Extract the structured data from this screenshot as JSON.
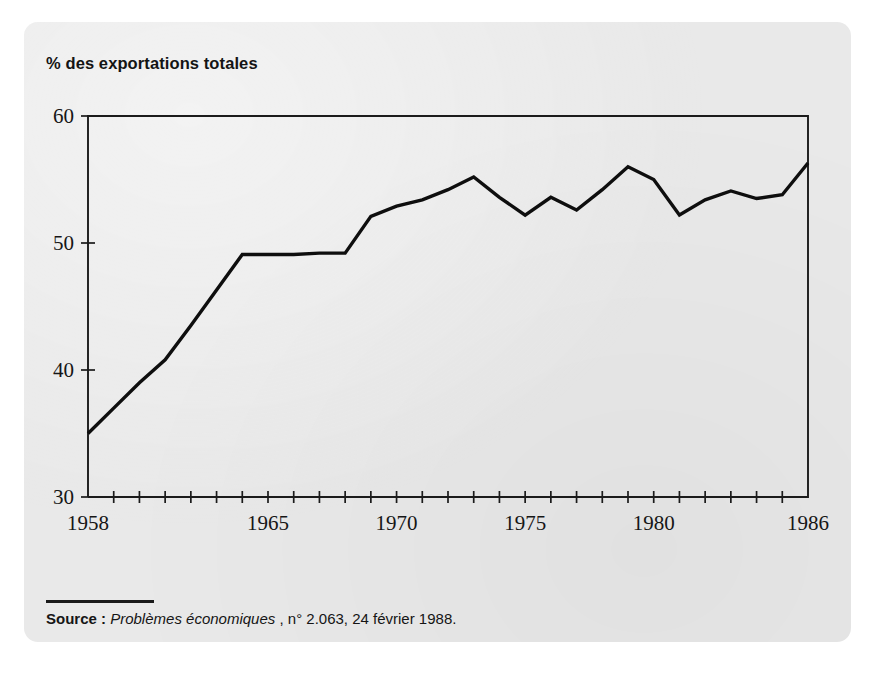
{
  "card": {
    "background_color": "#e9e9e9",
    "page_background_color": "#ffffff"
  },
  "chart_title": "% des exportations totales",
  "source": {
    "lead_label": "Source :",
    "publication": "Problèmes économiques",
    "reference": ", n° 2.063, 24 février 1988."
  },
  "chart_data": {
    "type": "line",
    "title": "% des exportations totales",
    "xlabel": "",
    "ylabel": "% des exportations totales",
    "xlim": [
      1958,
      1986
    ],
    "ylim": [
      30,
      60
    ],
    "ytick_labels": [
      "30",
      "40",
      "50",
      "60"
    ],
    "ytick_values": [
      30,
      40,
      50,
      60
    ],
    "xtick_labels": [
      "1958",
      "1965",
      "1970",
      "1975",
      "1980",
      "1986"
    ],
    "xtick_values": [
      1958,
      1965,
      1970,
      1975,
      1980,
      1986
    ],
    "xtick_minor_step": 1,
    "grid": false,
    "legend": false,
    "line_color": "#0e0e0e",
    "x": [
      1958,
      1959,
      1960,
      1961,
      1962,
      1963,
      1964,
      1965,
      1966,
      1967,
      1968,
      1969,
      1970,
      1971,
      1972,
      1973,
      1974,
      1975,
      1976,
      1977,
      1978,
      1979,
      1980,
      1981,
      1982,
      1983,
      1984,
      1985,
      1986
    ],
    "values": [
      35.0,
      37.0,
      39.0,
      40.8,
      43.5,
      46.3,
      49.1,
      49.1,
      49.1,
      49.2,
      49.2,
      52.1,
      52.9,
      53.4,
      54.2,
      55.2,
      53.6,
      52.2,
      53.6,
      52.6,
      54.2,
      56.0,
      55.0,
      52.2,
      53.4,
      54.1,
      53.5,
      53.8,
      56.3
    ]
  }
}
